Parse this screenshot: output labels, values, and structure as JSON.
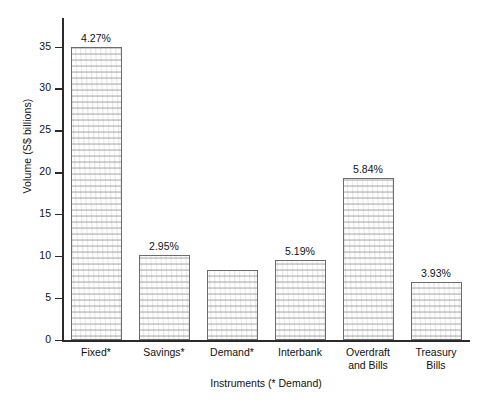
{
  "chart_data": {
    "type": "bar",
    "title": "",
    "xlabel": "Instruments (* Demand)",
    "ylabel": "Volume (S$ billions)",
    "categories": [
      "Fixed*",
      "Savings*",
      "Demand*",
      "Interbank",
      "Overdraft and Bills",
      "Treasury Bills"
    ],
    "category_lines": [
      [
        "Fixed*"
      ],
      [
        "Savings*"
      ],
      [
        "Demand*"
      ],
      [
        "Interbank"
      ],
      [
        "Overdraft",
        "and Bills"
      ],
      [
        "Treasury",
        "Bills"
      ]
    ],
    "values": [
      35.0,
      10.2,
      8.4,
      9.6,
      19.4,
      7.0
    ],
    "data_labels": [
      "4.27%",
      "2.95%",
      "5.19%",
      "5.84%",
      "3.93%"
    ],
    "bar_labels": [
      "4.27%",
      "2.95%",
      "",
      "5.19%",
      "5.84%",
      "3.93%"
    ],
    "ylim": [
      0,
      38.5
    ],
    "yticks": [
      0,
      5,
      10,
      15,
      20,
      25,
      30,
      35
    ],
    "ytick_labels": [
      "0",
      "5",
      "10",
      "15",
      "20",
      "25",
      "30",
      "35"
    ],
    "grid": false,
    "legend": null,
    "bar_fill": "#fdfdfd",
    "bar_edge": "#6c6c6c",
    "axis_color": "#2b2b2b",
    "text_color": "#111111"
  }
}
